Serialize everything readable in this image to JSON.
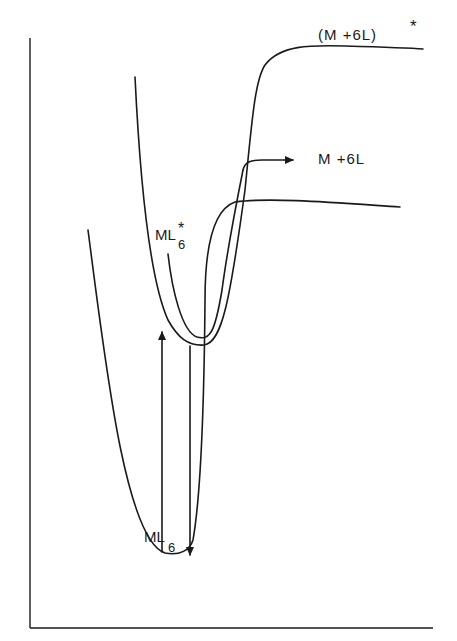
{
  "diagram": {
    "type": "potential-energy-curves",
    "labels": {
      "excited_dissociated": {
        "main": "(M +6L)",
        "sup": "*"
      },
      "ground_dissociated": "M +6L",
      "excited_complex": {
        "main": "ML",
        "sub": "6",
        "sup": "*"
      },
      "ground_complex": {
        "main": "ML",
        "sub": "6"
      }
    },
    "axes": {
      "x_label": "",
      "y_label": ""
    },
    "colors": {
      "line": "#1a1a1a",
      "background": "#ffffff"
    }
  }
}
